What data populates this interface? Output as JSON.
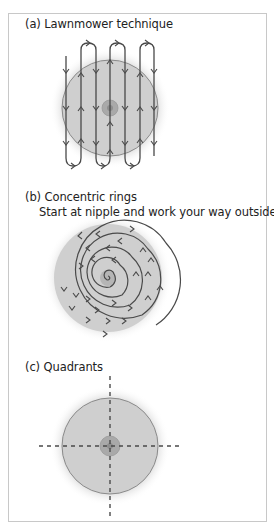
{
  "panels": [
    {
      "label": "(a) Lawnmower technique",
      "subtitle": "",
      "diagram": "lawnmower"
    },
    {
      "label": "(b) Concentric rings",
      "subtitle": "Start at nipple and work your way outside",
      "diagram": "spiral"
    },
    {
      "label": "(c) Quadrants",
      "subtitle": "",
      "diagram": "quadrants"
    }
  ],
  "colors": {
    "breast_fill": "#cfcfcf",
    "breast_outline": "#8a8a8a",
    "areola": "#a9a9a9",
    "nipple": "#8e8e8e",
    "path_line": "#4a4a4a",
    "frame_border": "#c8c8c8"
  }
}
